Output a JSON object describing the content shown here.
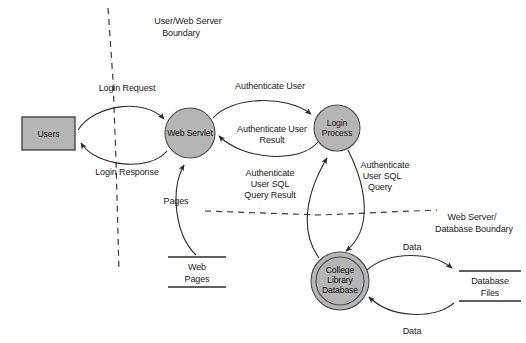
{
  "diagram": {
    "type": "data-flow-diagram",
    "colors": {
      "node_fill": "#b5b5b5",
      "node_stroke": "#4a4a4a",
      "edge": "#2b2b2b",
      "boundary": "#3a3a3a",
      "background": "#ffffff",
      "text": "#1a1a1a"
    },
    "nodes": {
      "users": {
        "label": "Users",
        "shape": "rectangle",
        "kind": "external-entity"
      },
      "web_servlet": {
        "label": "Web Servlet",
        "shape": "circle",
        "kind": "process"
      },
      "login_process": {
        "label_line1": "Login",
        "label_line2": "Process",
        "shape": "circle",
        "kind": "process"
      },
      "college_library_database": {
        "label_line1": "College",
        "label_line2": "Library",
        "label_line3": "Database",
        "shape": "double-circle",
        "kind": "process"
      },
      "web_pages": {
        "label_line1": "Web",
        "label_line2": "Pages",
        "shape": "open-rectangle",
        "kind": "data-store"
      },
      "database_files": {
        "label_line1": "Database",
        "label_line2": "Files",
        "shape": "open-rectangle",
        "kind": "data-store"
      }
    },
    "flows": {
      "login_request": {
        "label": "Login Request",
        "from": "users",
        "to": "web_servlet"
      },
      "login_response": {
        "label": "Login Response",
        "from": "web_servlet",
        "to": "users"
      },
      "authenticate_user": {
        "label": "Authenticate User",
        "from": "web_servlet",
        "to": "login_process"
      },
      "authenticate_user_result": {
        "label_line1": "Authenticate User",
        "label_line2": "Result",
        "from": "login_process",
        "to": "web_servlet"
      },
      "authenticate_user_sql_query": {
        "label_line1": "Authenticate",
        "label_line2": "User SQL",
        "label_line3": "Query",
        "from": "login_process",
        "to": "college_library_database"
      },
      "authenticate_user_sql_query_result": {
        "label_line1": "Authenticate",
        "label_line2": "User SQL",
        "label_line3": "Query Result",
        "from": "college_library_database",
        "to": "login_process"
      },
      "pages": {
        "label": "Pages",
        "from": "web_pages",
        "to": "web_servlet"
      },
      "data_out": {
        "label": "Data",
        "from": "college_library_database",
        "to": "database_files"
      },
      "data_in": {
        "label": "Data",
        "from": "database_files",
        "to": "college_library_database"
      }
    },
    "boundaries": {
      "user_web_server": {
        "label_line1": "User/Web Server",
        "label_line2": "Boundary",
        "orientation": "vertical"
      },
      "web_server_database": {
        "label_line1": "Web Server/",
        "label_line2": "Database Boundary",
        "orientation": "horizontal"
      }
    }
  }
}
